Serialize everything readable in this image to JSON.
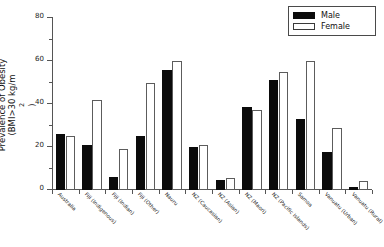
{
  "chart_data": {
    "type": "bar",
    "title": "",
    "subtitle": "",
    "xlabel": "",
    "ylabel_line1": "Prevalence of Obesity",
    "ylabel_line2": "(BMI>30 kg/m",
    "ylabel_exponent": "2",
    "ylabel_line2_end": ")",
    "ylim": [
      0,
      80
    ],
    "yticks": [
      0,
      20,
      40,
      60,
      80
    ],
    "ytick_labels": [
      "0",
      "20",
      "40",
      "60",
      "80"
    ],
    "yminor_ticks": [
      10,
      30,
      50,
      70
    ],
    "grid": false,
    "legend_position": "top-right",
    "categories": [
      "Australia",
      "Fiji (Indigenous)",
      "Fiji (Indian)",
      "Fiji (Other)",
      "Nauru",
      "NZ (Caucasian)",
      "NZ (Asian)",
      "NZ (Maori)",
      "NZ (Pacific Islands)",
      "Samoa",
      "Vanuatu (Urban)",
      "Vanuatu (Rural)"
    ],
    "series": [
      {
        "name": "Male",
        "color": "#0b0b0b",
        "fill": "solid",
        "values": [
          26,
          21,
          6,
          25,
          56,
          20,
          4.5,
          38.5,
          51,
          33,
          17.5,
          1.5
        ]
      },
      {
        "name": "Female",
        "color": "#ffffff",
        "fill": "open",
        "values": [
          25,
          42,
          19,
          50,
          60,
          21,
          5.5,
          37,
          55,
          60,
          29,
          4
        ]
      }
    ]
  },
  "legend": {
    "items": [
      {
        "label": "Male",
        "style": "male"
      },
      {
        "label": "Female",
        "style": "female"
      }
    ]
  },
  "colors": {
    "male": "#0b0b0b",
    "female": "#ffffff",
    "axis": "#555555",
    "text": "#1a1a1a",
    "background": "#ffffff"
  }
}
